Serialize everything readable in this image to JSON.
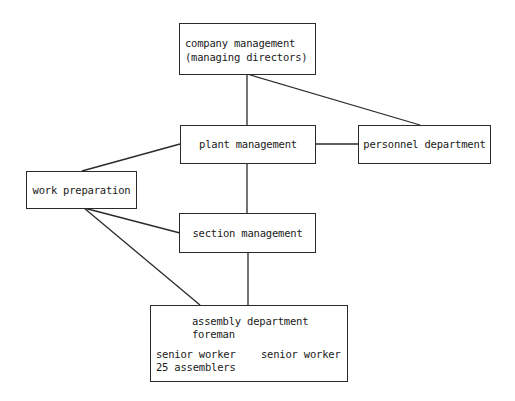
{
  "diagram": {
    "type": "organization-chart",
    "nodes": {
      "company": {
        "line1": "company management",
        "line2": "(managing directors)"
      },
      "plant": {
        "label": "plant management"
      },
      "personnel": {
        "label": "personnel department"
      },
      "work_prep": {
        "label": "work preparation"
      },
      "section": {
        "label": "section management"
      },
      "assembly": {
        "title": "assembly department",
        "foreman": "foreman",
        "senior_worker_left": "senior worker",
        "senior_worker_right": "senior worker",
        "assemblers": "25 assemblers"
      }
    },
    "edges": [
      [
        "company",
        "plant"
      ],
      [
        "company",
        "personnel"
      ],
      [
        "plant",
        "personnel"
      ],
      [
        "plant",
        "work_prep"
      ],
      [
        "plant",
        "section"
      ],
      [
        "work_prep",
        "section"
      ],
      [
        "work_prep",
        "assembly"
      ],
      [
        "section",
        "assembly"
      ]
    ],
    "colors": {
      "line": "#2a2a2a",
      "background": "#ffffff"
    }
  }
}
